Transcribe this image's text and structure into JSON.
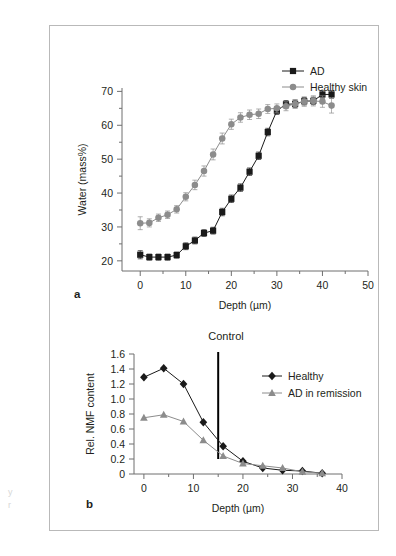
{
  "figure": {
    "background_color": "#ffffff",
    "frame_color": "#b9b9b9",
    "text_color": "#231f20"
  },
  "margin_fragments": [
    {
      "text": "y",
      "x": 8,
      "y": 487
    },
    {
      "text": "r",
      "x": 8,
      "y": 500
    }
  ],
  "panel_a": {
    "letter": "a",
    "title": "",
    "xlabel": "Depth (µm)",
    "ylabel": "Water (mass%)",
    "x_ticks": [
      "0",
      "10",
      "20",
      "30",
      "40",
      "50"
    ],
    "y_ticks": [
      "20",
      "30",
      "40",
      "50",
      "60",
      "70"
    ],
    "legend": [
      {
        "label": "AD",
        "color": "#1a1a1a",
        "marker": "square"
      },
      {
        "label": "Healthy skin",
        "color": "#8c8c8c",
        "marker": "circle"
      }
    ]
  },
  "panel_b": {
    "letter": "b",
    "title": "Control",
    "xlabel": "Depth (µm)",
    "ylabel": "Rel. NMF content",
    "x_ticks": [
      "0",
      "10",
      "20",
      "30",
      "40"
    ],
    "y_ticks": [
      "0",
      "0.2",
      "0.4",
      "0.6",
      "0.8",
      "1.0",
      "1.2",
      "1.4",
      "1.6"
    ],
    "legend": [
      {
        "label": "Healthy",
        "color": "#1a1a1a",
        "marker": "diamond"
      },
      {
        "label": "AD in remission",
        "color": "#8c8c8c",
        "marker": "triangle"
      }
    ],
    "marker_line": {
      "x": 15,
      "color": "#000000",
      "label": ""
    }
  },
  "chart_data": [
    {
      "type": "line",
      "panel": "a",
      "title": "",
      "xlabel": "Depth (µm)",
      "ylabel": "Water (mass%)",
      "xlim": [
        -4,
        50
      ],
      "ylim": [
        17,
        71
      ],
      "x_ticks": [
        0,
        10,
        20,
        30,
        40,
        50
      ],
      "y_ticks": [
        20,
        30,
        40,
        50,
        60,
        70
      ],
      "minor_tick_step_x": 5,
      "minor_tick_step_y": 5,
      "grid": false,
      "legend_position": "top-right",
      "error_bars": true,
      "series": [
        {
          "name": "AD",
          "color": "#1a1a1a",
          "marker": "square",
          "x": [
            0,
            2,
            4,
            6,
            8,
            10,
            12,
            14,
            16,
            18,
            20,
            22,
            24,
            26,
            28,
            30,
            32,
            34,
            36,
            38,
            40,
            42
          ],
          "y": [
            21.8,
            21.1,
            21.1,
            21.1,
            21.7,
            24.3,
            26.0,
            28.2,
            28.9,
            34.4,
            38.3,
            41.6,
            46.3,
            51.0,
            58.0,
            64.3,
            66.2,
            66.3,
            67.1,
            67.2,
            69.1,
            69.1
          ],
          "yerr": [
            1.2,
            0.9,
            0.9,
            0.9,
            0.9,
            1.0,
            1.0,
            1.0,
            1.0,
            1.1,
            1.1,
            1.1,
            1.1,
            1.1,
            1.1,
            1.1,
            1.1,
            1.1,
            1.1,
            1.1,
            1.1,
            1.1
          ]
        },
        {
          "name": "Healthy skin",
          "color": "#8c8c8c",
          "marker": "circle",
          "x": [
            0,
            2,
            4,
            6,
            8,
            10,
            12,
            14,
            16,
            18,
            20,
            22,
            24,
            26,
            28,
            30,
            32,
            34,
            36,
            38,
            40,
            42
          ],
          "y": [
            31.1,
            31.2,
            32.7,
            33.6,
            35.2,
            38.9,
            42.4,
            46.5,
            51.4,
            56.1,
            60.3,
            62.3,
            63.1,
            63.4,
            64.8,
            65.0,
            65.6,
            66.3,
            67.0,
            67.2,
            67.0,
            65.8
          ],
          "yerr": [
            1.9,
            1.2,
            1.1,
            1.1,
            1.1,
            1.2,
            1.4,
            1.5,
            1.6,
            1.6,
            1.5,
            1.4,
            1.4,
            1.4,
            1.3,
            1.3,
            1.3,
            1.3,
            1.4,
            1.5,
            1.7,
            2.2
          ]
        }
      ]
    },
    {
      "type": "line",
      "panel": "b",
      "title": "Control",
      "xlabel": "Depth (µm)",
      "ylabel": "Rel. NMF content",
      "xlim": [
        -2,
        40
      ],
      "ylim": [
        0,
        1.6
      ],
      "x_ticks": [
        0,
        10,
        20,
        30,
        40
      ],
      "y_ticks": [
        0,
        0.2,
        0.4,
        0.6,
        0.8,
        1.0,
        1.2,
        1.4,
        1.6
      ],
      "minor_tick_step_x": 5,
      "grid": false,
      "legend_position": "right",
      "error_bars": false,
      "annotations": [
        {
          "type": "vline",
          "x": 15,
          "color": "#000000",
          "width": 2
        }
      ],
      "series": [
        {
          "name": "Healthy",
          "color": "#1a1a1a",
          "marker": "diamond",
          "x": [
            0,
            4,
            8,
            12,
            16,
            20,
            24,
            28,
            32,
            36
          ],
          "y": [
            1.29,
            1.41,
            1.2,
            0.69,
            0.37,
            0.17,
            0.08,
            0.05,
            0.04,
            0.01
          ]
        },
        {
          "name": "AD in remission",
          "color": "#8c8c8c",
          "marker": "triangle",
          "x": [
            0,
            4,
            8,
            12,
            16,
            20,
            24,
            28,
            32,
            36
          ],
          "y": [
            0.75,
            0.79,
            0.7,
            0.45,
            0.24,
            0.14,
            0.11,
            0.08,
            0.03,
            0.01
          ]
        }
      ]
    }
  ]
}
